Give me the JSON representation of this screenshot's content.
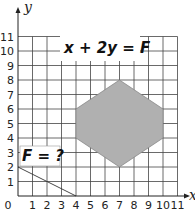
{
  "chart_data": {
    "type": "diagram",
    "title": "",
    "xlabel": "x",
    "ylabel": "y",
    "xlim": [
      0,
      11
    ],
    "ylim": [
      0,
      11
    ],
    "x_ticks": [
      "0",
      "1",
      "2",
      "3",
      "4",
      "5",
      "6",
      "7",
      "8",
      "9",
      "10",
      "11"
    ],
    "y_ticks": [
      "1",
      "2",
      "3",
      "4",
      "5",
      "6",
      "7",
      "8",
      "9",
      "10",
      "11"
    ],
    "grid": true,
    "feasible_region": {
      "shape": "hexagon",
      "fill": "#b0b0b0",
      "vertices": [
        [
          4,
          6
        ],
        [
          7,
          8
        ],
        [
          10,
          6
        ],
        [
          10,
          4
        ],
        [
          7,
          2
        ],
        [
          4,
          4
        ]
      ]
    },
    "objective_line": {
      "label": "F = ?",
      "points": [
        [
          0,
          2
        ],
        [
          4,
          0
        ]
      ]
    },
    "annotations": [
      {
        "text": "x + 2y = F",
        "position": [
          3,
          10
        ]
      },
      {
        "text": "F = ?",
        "position": [
          0,
          3
        ]
      }
    ]
  },
  "labels": {
    "x_axis": "x",
    "y_axis": "y",
    "equation": "x + 2y = F",
    "question": "F = ?",
    "origin": "0"
  }
}
